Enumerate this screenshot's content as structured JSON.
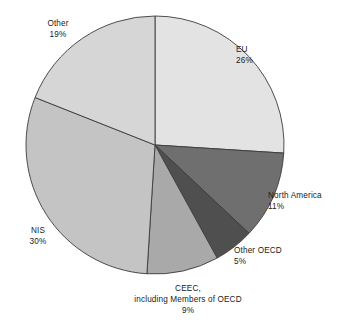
{
  "chart_data": {
    "type": "pie",
    "title": "",
    "subtitle": "",
    "xlabel": "",
    "ylabel": "",
    "legend_position": "none",
    "grid": false,
    "labels_on_slices": false,
    "start_angle_deg": 0,
    "direction": "clockwise",
    "categories": [
      "EU",
      "North America",
      "Other OECD",
      "CEEC, including Members of OECD",
      "NIS",
      "Other"
    ],
    "values": [
      26,
      11,
      5,
      9,
      30,
      19
    ],
    "unit": "%",
    "total": 100,
    "slices": [
      {
        "name": "EU",
        "display_name": "EU",
        "value": 26,
        "value_text": "26%",
        "color": "#e3e3e3",
        "start_deg": 0,
        "end_deg": 93.6
      },
      {
        "name": "North America",
        "display_name": "North America",
        "value": 11,
        "value_text": "11%",
        "color": "#6f6f6f",
        "start_deg": 93.6,
        "end_deg": 133.2
      },
      {
        "name": "Other OECD",
        "display_name": "Other OECD",
        "value": 5,
        "value_text": "5%",
        "color": "#4f4f4f",
        "start_deg": 133.2,
        "end_deg": 151.2
      },
      {
        "name": "CEEC",
        "display_name": "CEEC,",
        "display_name_line2": "including Members of OECD",
        "value": 9,
        "value_text": "9%",
        "color": "#a9a9a9",
        "start_deg": 151.2,
        "end_deg": 183.6
      },
      {
        "name": "NIS",
        "display_name": "NIS",
        "value": 30,
        "value_text": "30%",
        "color": "#c4c4c4",
        "start_deg": 183.6,
        "end_deg": 291.6
      },
      {
        "name": "Other",
        "display_name": "Other",
        "value": 19,
        "value_text": "19%",
        "color": "#d6d6d6",
        "start_deg": 291.6,
        "end_deg": 360
      }
    ],
    "geometry": {
      "center_x": 155,
      "center_y": 145,
      "radius": 129
    },
    "style": {
      "background": "#ffffff",
      "outline": "#3b3b3b",
      "text_color": "#1a1a1a"
    }
  }
}
